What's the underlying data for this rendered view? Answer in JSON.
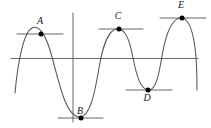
{
  "figure": {
    "background_color": "#ffffff",
    "curve_color": "#555555",
    "axis_color": "#555555",
    "tangent_color": "#555555",
    "point_color": "#000000",
    "label_color": "#1a1a1a"
  },
  "axes": {
    "horizontal": {
      "name": "x-axis",
      "y": 58.5,
      "x_start": 11,
      "x_end": 198
    },
    "vertical": {
      "name": "y-axis",
      "x": 73,
      "y_start": 13,
      "y_end": 122
    }
  },
  "chart_data": {
    "type": "line",
    "title": "",
    "xlabel": "",
    "ylabel": "",
    "grid": false,
    "legend": null,
    "axis_crossing": {
      "x": 73,
      "y": 58.5
    },
    "curve_description": "Smooth periodic wave alternating between three maxima (A, C, E) and two minima (B, D)",
    "curve_path": "M 15,93 C 18,60 24,32 32,28 C 40,24 47,38 52,57 C 60,86 66,116 79,117 C 90,118 95,92 99,68 C 103,45 108,30 117,29 C 126,28 130,42 133,58 C 137,78 141,89 148,90 C 156,91 159,74 162,56 C 166,33 172,18 181,18 C 189,18 194,34 196,57 C 197,70 197,80 197,90",
    "points": [
      {
        "id": "A",
        "label": "A",
        "type": "local-maximum",
        "x": 41,
        "y": 34,
        "label_x": 40,
        "label_y": 24,
        "tangent": {
          "x1": 17,
          "x2": 63,
          "y": 34,
          "slope": 0
        }
      },
      {
        "id": "B",
        "label": "B",
        "type": "local-minimum",
        "x": 81,
        "y": 118,
        "label_x": 80,
        "label_y": 114,
        "tangent": {
          "x1": 58,
          "x2": 103,
          "y": 118,
          "slope": 0
        }
      },
      {
        "id": "C",
        "label": "C",
        "type": "local-maximum",
        "x": 119,
        "y": 29,
        "label_x": 118,
        "label_y": 19,
        "tangent": {
          "x1": 99,
          "x2": 143,
          "y": 29,
          "slope": 0
        }
      },
      {
        "id": "D",
        "label": "D",
        "type": "local-minimum",
        "x": 148,
        "y": 90,
        "label_x": 147,
        "label_y": 101,
        "tangent": {
          "x1": 126,
          "x2": 172,
          "y": 90,
          "slope": 0
        }
      },
      {
        "id": "E",
        "label": "E",
        "type": "local-maximum",
        "x": 182,
        "y": 18,
        "label_x": 181,
        "label_y": 8,
        "tangent": {
          "x1": 160,
          "x2": 206,
          "y": 18,
          "slope": 0
        }
      }
    ]
  }
}
